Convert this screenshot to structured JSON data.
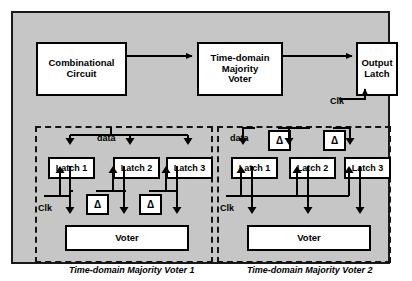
{
  "figure": {
    "background_color": "#c6c6c6",
    "border_color": "#1a1a1a",
    "block_fill": "#ffffff"
  },
  "top_flow": {
    "combinational_circuit": "Combinational\nCircuit",
    "combinational_circuit_line1": "Combinational",
    "combinational_circuit_line2": "Circuit",
    "time_domain_voter_line1": "Time-domain",
    "time_domain_voter_line2": "Majority",
    "time_domain_voter_line3": "Voter",
    "output_latch_line1": "Output",
    "output_latch_line2": "Latch",
    "output_clk_label": "Clk"
  },
  "panel1": {
    "caption": "Time-domain Majority Voter 1",
    "data_label": "data",
    "clk_label": "Clk",
    "latches": [
      "Latch 1",
      "Latch 2",
      "Latch 3"
    ],
    "delays": [
      "Δ",
      "Δ"
    ],
    "voter_label": "Voter"
  },
  "panel2": {
    "caption": "Time-domain Majority Voter 2",
    "data_label": "data",
    "clk_label": "Clk",
    "latches": [
      "Latch 1",
      "Latch 2",
      "Latch 3"
    ],
    "delays": [
      "Δ",
      "Δ"
    ],
    "voter_label": "Voter"
  }
}
